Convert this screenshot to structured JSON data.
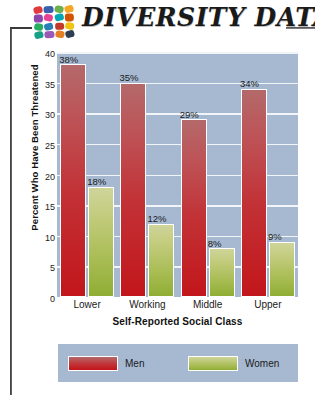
{
  "header": {
    "title": "DIVERSITY DATA",
    "logo_name": "diversity-data-logo",
    "logo_colors": [
      "#e03a3e",
      "#3a5fae",
      "#6ab04c",
      "#f5a623",
      "#8e44ad",
      "#e84393",
      "#00a8b5",
      "#d35400",
      "#27ae60",
      "#2980b9",
      "#c0392b",
      "#f1c40f",
      "#16a085",
      "#9b59b6",
      "#e67e22",
      "#2c3e50"
    ]
  },
  "chart_data": {
    "type": "bar",
    "title": "",
    "categories": [
      "Lower",
      "Working",
      "Middle",
      "Upper"
    ],
    "series": [
      {
        "name": "Men",
        "color": "#c2161b",
        "values": [
          38,
          35,
          29,
          34
        ],
        "labels": [
          "38%",
          "35%",
          "29%",
          "34%"
        ]
      },
      {
        "name": "Women",
        "color": "#8fae34",
        "values": [
          18,
          12,
          8,
          9
        ],
        "labels": [
          "18%",
          "12%",
          "8%",
          "9%"
        ]
      }
    ],
    "xlabel": "Self-Reported Social Class",
    "ylabel": "Percent Who Have Been Threatened",
    "ylim": [
      0,
      40
    ],
    "yticks": [
      0,
      5,
      10,
      15,
      20,
      25,
      30,
      35,
      40
    ],
    "ytick_labels": [
      "0",
      "5",
      "10",
      "15",
      "20",
      "25",
      "30",
      "35",
      "40"
    ],
    "grid": true,
    "legend_position": "bottom",
    "plot_background": "#a6b9d1",
    "gridline_color": "#f2f5f8"
  }
}
